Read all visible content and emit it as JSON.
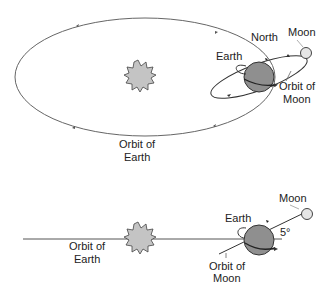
{
  "top_view": {
    "labels": {
      "north": "North",
      "moon": "Moon",
      "earth": "Earth",
      "orbit_of_moon_line1": "Orbit of",
      "orbit_of_moon_line2": "Moon",
      "orbit_of_earth_line1": "Orbit of",
      "orbit_of_earth_line2": "Earth"
    }
  },
  "side_view": {
    "labels": {
      "moon": "Moon",
      "earth": "Earth",
      "angle": "5°",
      "orbit_of_earth_line1": "Orbit of",
      "orbit_of_earth_line2": "Earth",
      "orbit_of_moon_line1": "Orbit of",
      "orbit_of_moon_line2": "Moon"
    }
  },
  "colors": {
    "line": "#555555",
    "earth_fill": "#8f8f8f",
    "sun_fill": "#c4c4c4",
    "moon_fill": "#e6e6e6"
  }
}
